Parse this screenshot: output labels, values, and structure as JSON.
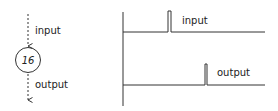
{
  "node": {
    "label": "16",
    "input_label": "input",
    "output_label": "output"
  },
  "timing": {
    "input_label": "input",
    "output_label": "output"
  },
  "colors": {
    "stroke": "#333333",
    "text": "#222222"
  }
}
